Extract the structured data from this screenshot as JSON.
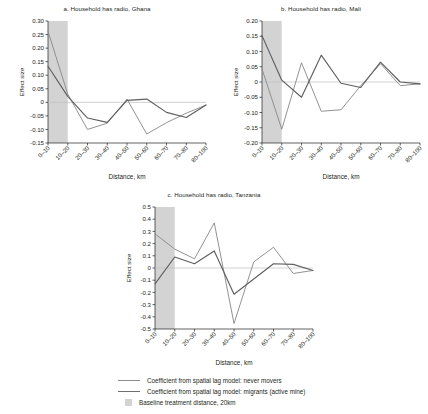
{
  "figure": {
    "axis_label_x": "Distance, km",
    "axis_label_y": "Effect size"
  },
  "legend": {
    "items": [
      {
        "type": "line-light",
        "label": "Coefficient from spatial lag model: never movers"
      },
      {
        "type": "line-dark",
        "label": "Coefficient from spatial lag model: migrants (active mine)"
      },
      {
        "type": "box",
        "label": "Baseline treatment distance, 20km"
      }
    ]
  },
  "colors": {
    "never_movers": "#8c8c8c",
    "migrants": "#5f5f5f",
    "shaded_band": "#d3d3d3",
    "axis": "#231f20",
    "zero_line": "#bfbfbf"
  },
  "chart_data": [
    {
      "id": "a",
      "type": "line",
      "title": "a. Household has radio, Ghana",
      "xlabel": "Distance, km",
      "ylabel": "Effect size",
      "categories": [
        "0–10",
        "10–20",
        "20–30",
        "30–40",
        "40–50",
        "50–60",
        "60–70",
        "70–80",
        "80–100"
      ],
      "ylim": [
        -0.15,
        0.3
      ],
      "yticks": [
        "0.30",
        "0.25",
        "0.20",
        "0.15",
        "0.10",
        "0.05",
        "0",
        "-0.05",
        "-0.10",
        "-0.15"
      ],
      "ytick_values": [
        0.3,
        0.25,
        0.2,
        0.15,
        0.1,
        0.05,
        0,
        -0.05,
        -0.1,
        -0.15
      ],
      "grid": false,
      "zero_line": true,
      "shaded_band": {
        "from_category": "0–10",
        "to_category": "10–20",
        "label": "Baseline treatment distance, 20km"
      },
      "series": [
        {
          "name": "Coefficient from spatial lag model: never movers",
          "values": [
            0.262,
            0.03,
            -0.1,
            -0.077,
            0.012,
            -0.117,
            -0.075,
            -0.04,
            -0.01
          ]
        },
        {
          "name": "Coefficient from spatial lag model: migrants (active mine)",
          "values": [
            0.133,
            0.022,
            -0.058,
            -0.074,
            0.007,
            0.012,
            -0.037,
            -0.056,
            -0.01
          ]
        }
      ]
    },
    {
      "id": "b",
      "type": "line",
      "title": "b. Household has radio, Mali",
      "xlabel": "Distance, km",
      "ylabel": "Effect size",
      "categories": [
        "0–10",
        "10–20",
        "20–30",
        "30–40",
        "40–50",
        "50–60",
        "60–70",
        "70–80",
        "80–100"
      ],
      "ylim": [
        -0.2,
        0.2
      ],
      "yticks": [
        "0.20",
        "0.15",
        "0.10",
        "0.05",
        "0",
        "-0.05",
        "-0.10",
        "-0.15",
        "-0.20"
      ],
      "ytick_values": [
        0.2,
        0.15,
        0.1,
        0.05,
        0,
        -0.05,
        -0.1,
        -0.15,
        -0.2
      ],
      "grid": false,
      "zero_line": true,
      "shaded_band": {
        "from_category": "0–10",
        "to_category": "10–20",
        "label": "Baseline treatment distance, 20km"
      },
      "series": [
        {
          "name": "Coefficient from spatial lag model: never movers",
          "values": [
            0.043,
            -0.155,
            0.063,
            -0.096,
            -0.091,
            -0.012,
            0.06,
            -0.012,
            -0.006
          ]
        },
        {
          "name": "Coefficient from spatial lag model: migrants (active mine)",
          "values": [
            0.152,
            0.006,
            -0.05,
            0.088,
            -0.004,
            -0.018,
            0.065,
            0.0,
            -0.006
          ]
        }
      ]
    },
    {
      "id": "c",
      "type": "line",
      "title": "c. Household has radio, Tanzania",
      "xlabel": "Distance, km",
      "ylabel": "Effect size",
      "categories": [
        "0–10",
        "10–20",
        "20–30",
        "30–40",
        "40–50",
        "50–60",
        "60–70",
        "70–80",
        "80–100"
      ],
      "ylim": [
        -0.5,
        0.5
      ],
      "yticks": [
        "0.5",
        "0.4",
        "0.3",
        "0.2",
        "0.1",
        "0",
        "-0.1",
        "-0.2",
        "-0.3",
        "-0.4",
        "-0.5"
      ],
      "ytick_values": [
        0.5,
        0.4,
        0.3,
        0.2,
        0.1,
        0,
        -0.1,
        -0.2,
        -0.3,
        -0.4,
        -0.5
      ],
      "grid": false,
      "zero_line": true,
      "shaded_band": {
        "from_category": "0–10",
        "to_category": "10–20",
        "label": "Baseline treatment distance, 20km"
      },
      "series": [
        {
          "name": "Coefficient from spatial lag model: never movers",
          "values": [
            0.28,
            0.155,
            0.075,
            0.37,
            -0.455,
            0.05,
            0.17,
            -0.045,
            -0.02
          ]
        },
        {
          "name": "Coefficient from spatial lag model: migrants (active mine)",
          "values": [
            -0.13,
            0.09,
            0.035,
            0.14,
            -0.215,
            -0.09,
            0.035,
            0.03,
            -0.02
          ]
        }
      ]
    }
  ]
}
